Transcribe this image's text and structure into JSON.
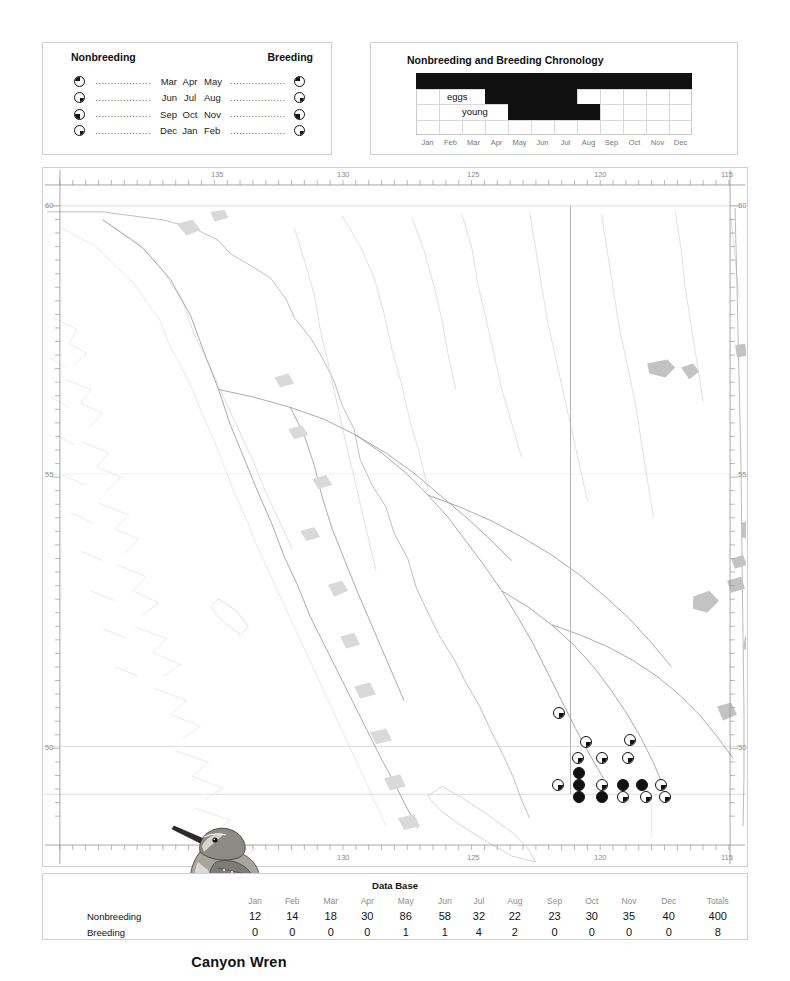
{
  "legend": {
    "heading_nonbreeding": "Nonbreeding",
    "heading_breeding": "Breeding",
    "dots_left": "..................",
    "dots_right": "..................",
    "rows": [
      {
        "left_symbol": "pie-quarter-top-left",
        "left_label": "Mar",
        "mid_label": "Apr",
        "right_label": "May",
        "right_symbol": "pie-quarter-top-left"
      },
      {
        "left_symbol": "pie-quarter-bottom-right",
        "left_label": "Jun",
        "mid_label": "Jul",
        "right_label": "Aug",
        "right_symbol": "pie-quarter-bottom-right"
      },
      {
        "left_symbol": "pie-quarter-bottom-left",
        "left_label": "Sep",
        "mid_label": "Oct",
        "right_label": "Nov",
        "right_symbol": "pie-quarter-bottom-left"
      },
      {
        "left_symbol": "pie-quarter-bottom-right-low",
        "left_label": "Dec",
        "mid_label": "Jan",
        "right_label": "Feb",
        "right_symbol": "pie-quarter-bottom-right-low"
      }
    ]
  },
  "chronology": {
    "title": "Nonbreeding and Breeding Chronology",
    "months": [
      "Jan",
      "Feb",
      "Mar",
      "Apr",
      "May",
      "Jun",
      "Jul",
      "Aug",
      "Sep",
      "Oct",
      "Nov",
      "Dec"
    ],
    "label_eggs": "eggs",
    "label_young": "young",
    "rows": 4,
    "bars": [
      {
        "row": 1,
        "start_month": 1,
        "end_month": 12,
        "name": "nonbreeding-bar"
      },
      {
        "row": 2,
        "start_month": 4,
        "end_month": 7,
        "name": "eggs-bar"
      },
      {
        "row": 3,
        "start_month": 5,
        "end_month": 8,
        "name": "young-bar"
      }
    ]
  },
  "map": {
    "longitude_ticks": [
      "135",
      "130",
      "125",
      "120",
      "115"
    ],
    "latitude_ticks": [
      "60",
      "55",
      "50"
    ],
    "species_name": "Canyon Wren",
    "records": [
      {
        "x": 558,
        "y": 712,
        "fill": "q-br"
      },
      {
        "x": 585,
        "y": 741,
        "fill": "q-br"
      },
      {
        "x": 629,
        "y": 739,
        "fill": "q-br"
      },
      {
        "x": 577,
        "y": 757,
        "fill": "q-br"
      },
      {
        "x": 601,
        "y": 757,
        "fill": "q-br"
      },
      {
        "x": 627,
        "y": 757,
        "fill": "q-br"
      },
      {
        "x": 578,
        "y": 772,
        "fill": "full"
      },
      {
        "x": 557,
        "y": 784,
        "fill": "q-br"
      },
      {
        "x": 578,
        "y": 784,
        "fill": "full"
      },
      {
        "x": 601,
        "y": 784,
        "fill": "q-br"
      },
      {
        "x": 622,
        "y": 784,
        "fill": "full"
      },
      {
        "x": 641,
        "y": 784,
        "fill": "full"
      },
      {
        "x": 660,
        "y": 784,
        "fill": "q-br"
      },
      {
        "x": 578,
        "y": 796,
        "fill": "full"
      },
      {
        "x": 601,
        "y": 796,
        "fill": "full"
      },
      {
        "x": 622,
        "y": 796,
        "fill": "q-br"
      },
      {
        "x": 645,
        "y": 796,
        "fill": "q-br"
      },
      {
        "x": 664,
        "y": 796,
        "fill": "q-br"
      }
    ]
  },
  "database": {
    "title": "Data Base",
    "columns": [
      "Jan",
      "Feb",
      "Mar",
      "Apr",
      "May",
      "Jun",
      "Jul",
      "Aug",
      "Sep",
      "Oct",
      "Nov",
      "Dec",
      "Totals"
    ],
    "rows": [
      {
        "label": "Nonbreeding",
        "values": [
          "12",
          "14",
          "18",
          "30",
          "86",
          "58",
          "32",
          "22",
          "23",
          "30",
          "35",
          "40"
        ],
        "total": "400"
      },
      {
        "label": "Breeding",
        "values": [
          "0",
          "0",
          "0",
          "0",
          "1",
          "1",
          "4",
          "2",
          "0",
          "0",
          "0",
          "0"
        ],
        "total": "8"
      }
    ]
  },
  "chart_data": {
    "type": "table",
    "title": "Data Base",
    "categories": [
      "Jan",
      "Feb",
      "Mar",
      "Apr",
      "May",
      "Jun",
      "Jul",
      "Aug",
      "Sep",
      "Oct",
      "Nov",
      "Dec"
    ],
    "series": [
      {
        "name": "Nonbreeding",
        "values": [
          12,
          14,
          18,
          30,
          86,
          58,
          32,
          22,
          23,
          30,
          35,
          40
        ],
        "total": 400
      },
      {
        "name": "Breeding",
        "values": [
          0,
          0,
          0,
          0,
          1,
          1,
          4,
          2,
          0,
          0,
          0,
          0
        ],
        "total": 8
      }
    ],
    "ylabel": "Number of records",
    "xlabel": "Month",
    "grid": false,
    "legend": "none"
  }
}
